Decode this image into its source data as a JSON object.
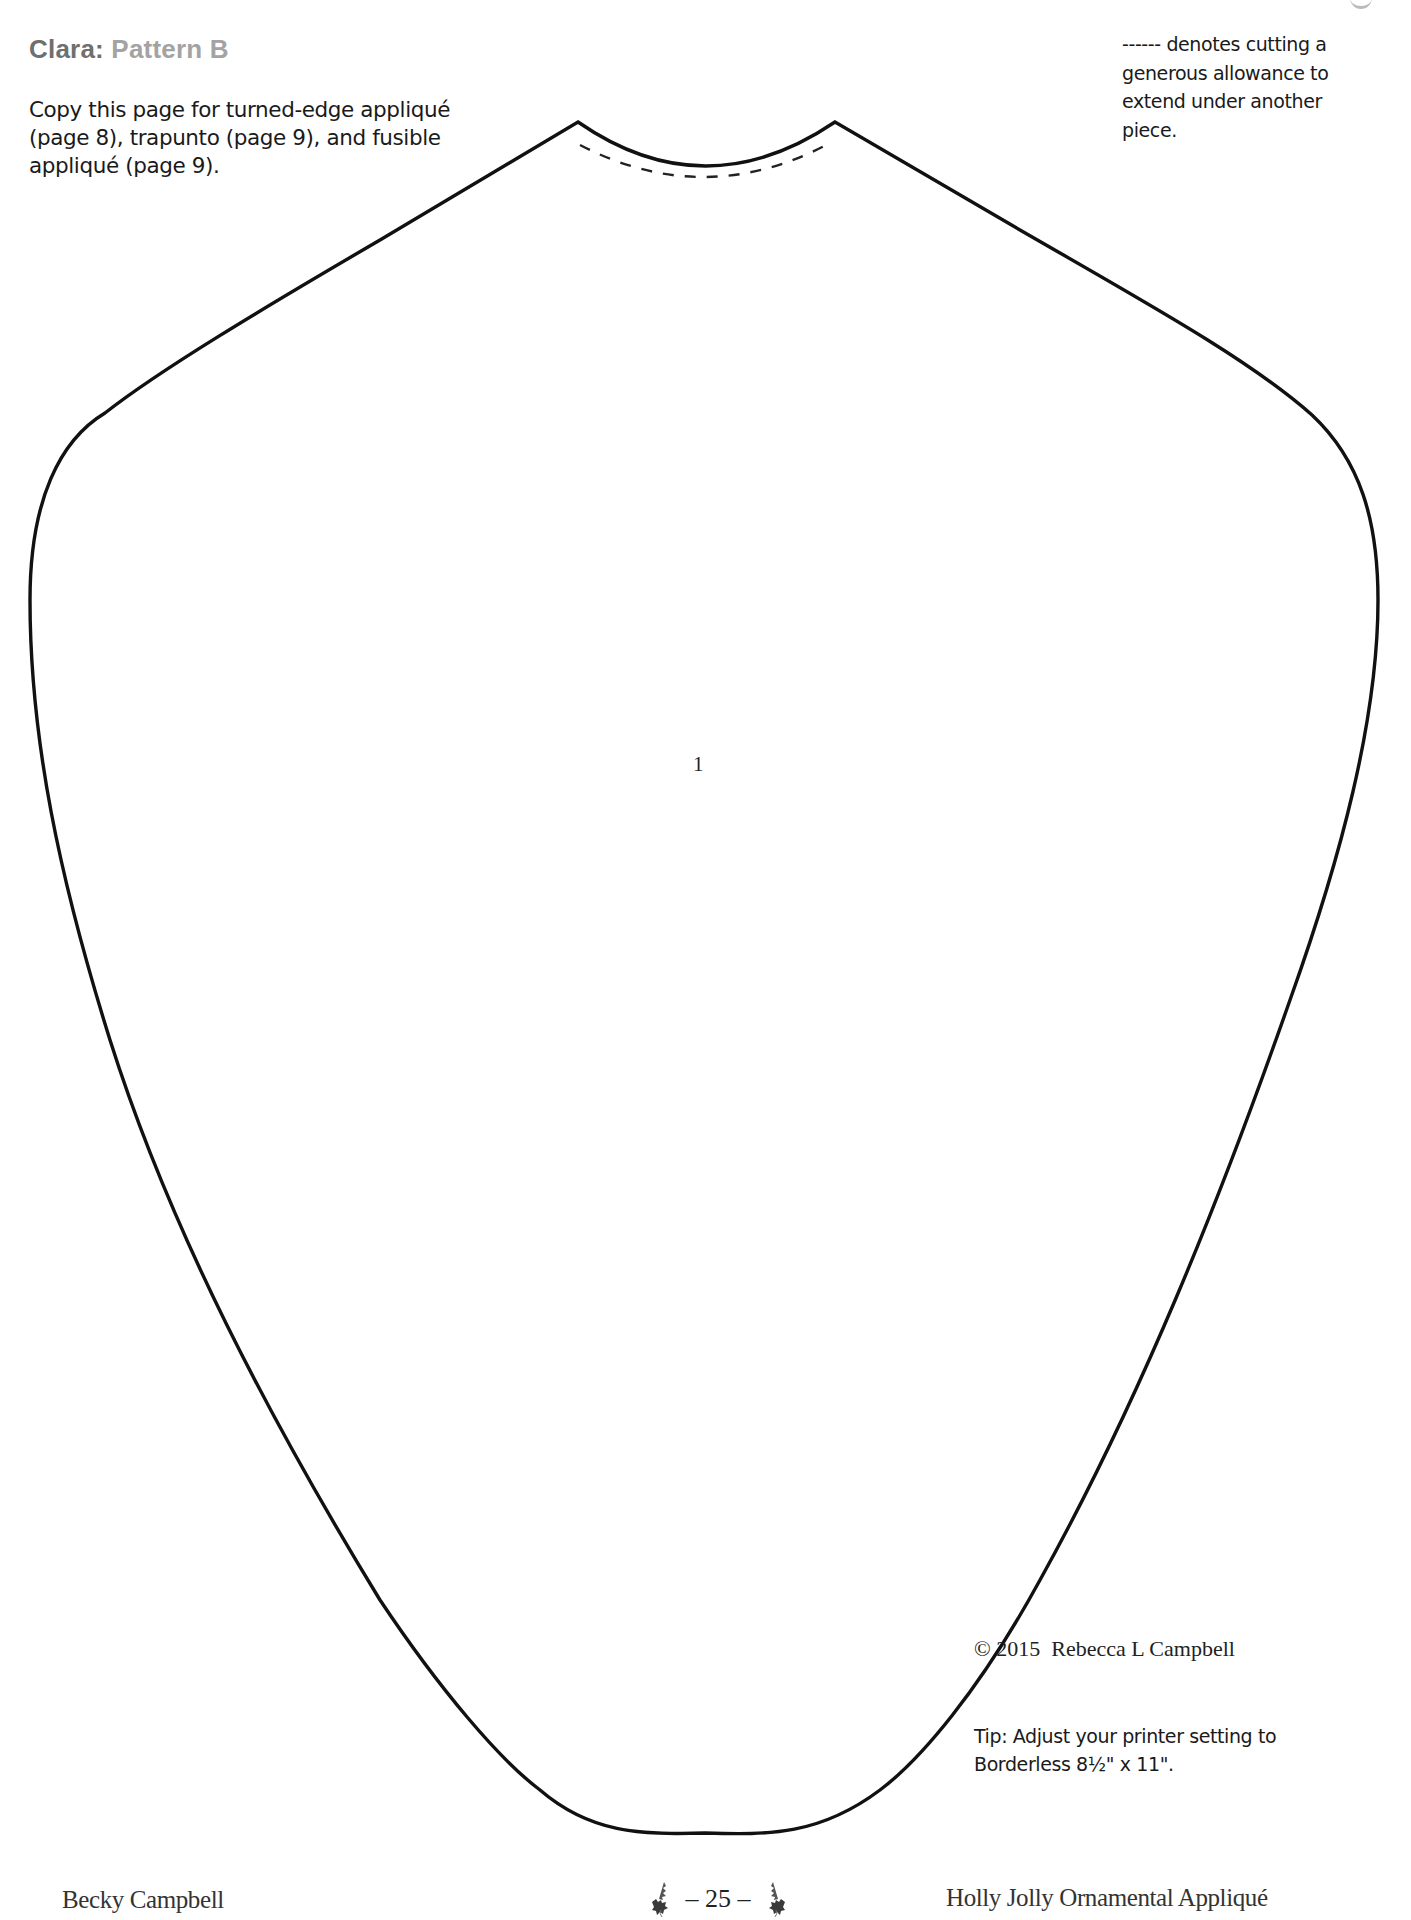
{
  "header": {
    "title_name": "Clara:",
    "title_pattern": "Pattern B",
    "intro_text": "Copy this page for turned-edge appliqué (page 8), trapunto (page 9), and fusible appliqué (page 9).",
    "legend_text": "------ denotes cutting a generous allowance to extend under another piece."
  },
  "pattern": {
    "piece_number": "1",
    "outline_color": "#111111",
    "dashed_line_meaning": "cutting allowance"
  },
  "notes": {
    "copyright": "© 2015  Rebecca L Campbell",
    "tip": "Tip: Adjust your printer setting to Borderless 8½\" x 11\"."
  },
  "footer": {
    "author": "Becky Campbell",
    "page_number": "– 25 –",
    "book_title": "Holly Jolly Ornamental Appliqué",
    "ornament_icon": "holly-leaf-icon"
  },
  "colors": {
    "title_name": "#6f6f6f",
    "title_pattern": "#a3a3a3",
    "holly": "#3a3a3a"
  }
}
